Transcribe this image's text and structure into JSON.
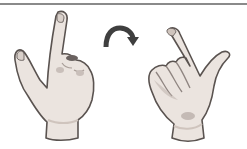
{
  "figure": {
    "colors": {
      "rule": "#8a8a8a",
      "skin": "#ebe4df",
      "skin_shadow": "#cfc4bd",
      "outline": "#5a5350",
      "arrow": "#3f3f3f"
    },
    "elements": [
      {
        "name": "left-hand",
        "gesture": "index finger pointing up, thumb out"
      },
      {
        "name": "rotate-arrow",
        "direction": "clockwise"
      },
      {
        "name": "right-hand",
        "gesture": "index finger tilted, thumb extended right"
      }
    ]
  }
}
